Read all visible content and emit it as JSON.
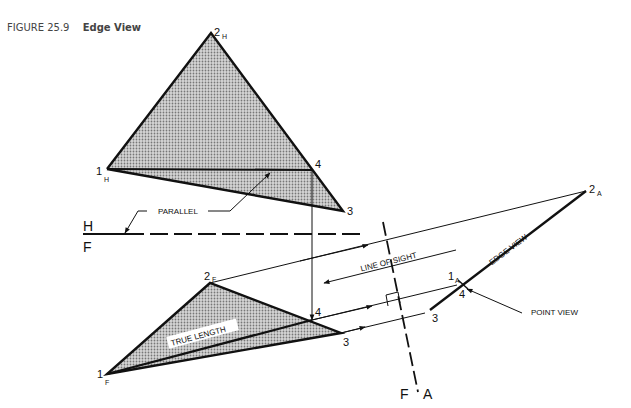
{
  "caption": {
    "number": "FIGURE 25.9",
    "title": "Edge View"
  },
  "colors": {
    "ink": "#111111",
    "shade": "#b0b0b0",
    "caption": "#444444"
  },
  "top_view": {
    "p1": {
      "label": "1",
      "sub": "H"
    },
    "p2": {
      "label": "2",
      "sub": "H"
    },
    "p3": {
      "label": "3"
    },
    "p4": {
      "label": "4"
    },
    "annotation": "PARALLEL"
  },
  "fold_hf": {
    "upper": "H",
    "lower": "F"
  },
  "front_view": {
    "p1": {
      "label": "1",
      "sub": "F"
    },
    "p2": {
      "label": "2",
      "sub": "F"
    },
    "p3": {
      "label": "3"
    },
    "p4": {
      "label": "4"
    },
    "annotation": "TRUE LENGTH"
  },
  "fold_fa": {
    "left": "F",
    "right": "A"
  },
  "aux_view": {
    "p1": {
      "label": "1",
      "sub": "A"
    },
    "p2": {
      "label": "2",
      "sub": "A"
    },
    "p3": {
      "label": "3"
    },
    "p4": {
      "label": "4"
    },
    "edge_label": "EDGE VIEW",
    "sight_label": "LINE OF SIGHT",
    "point_label": "POINT VIEW"
  }
}
